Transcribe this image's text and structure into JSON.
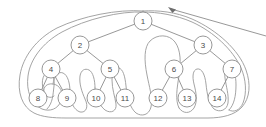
{
  "figure": {
    "colors": {
      "stroke": "#8c8c8c",
      "contour": "#9a9a9a",
      "node_fill": "#ffffff",
      "label": "#4a4a4a",
      "background": "#ffffff"
    }
  },
  "tree": {
    "node_radius": 9,
    "nodes": [
      {
        "id": "1",
        "label": "1",
        "x": 143,
        "y": 21,
        "level": 0
      },
      {
        "id": "2",
        "label": "2",
        "x": 80,
        "y": 45,
        "level": 1
      },
      {
        "id": "3",
        "label": "3",
        "x": 203,
        "y": 45,
        "level": 1
      },
      {
        "id": "4",
        "label": "4",
        "x": 51,
        "y": 69,
        "level": 2
      },
      {
        "id": "5",
        "label": "5",
        "x": 110,
        "y": 69,
        "level": 2
      },
      {
        "id": "6",
        "label": "6",
        "x": 174,
        "y": 69,
        "level": 2
      },
      {
        "id": "7",
        "label": "7",
        "x": 232,
        "y": 69,
        "level": 2
      },
      {
        "id": "8",
        "label": "8",
        "x": 38,
        "y": 98,
        "level": 3
      },
      {
        "id": "9",
        "label": "9",
        "x": 67,
        "y": 98,
        "level": 3
      },
      {
        "id": "10",
        "label": "10",
        "x": 96,
        "y": 98,
        "level": 3
      },
      {
        "id": "11",
        "label": "11",
        "x": 125,
        "y": 98,
        "level": 3
      },
      {
        "id": "12",
        "label": "12",
        "x": 158,
        "y": 98,
        "level": 3
      },
      {
        "id": "13",
        "label": "13",
        "x": 187,
        "y": 98,
        "level": 3
      },
      {
        "id": "14",
        "label": "14",
        "x": 217,
        "y": 98,
        "level": 3
      }
    ],
    "edges": [
      {
        "from": "1",
        "to": "2"
      },
      {
        "from": "1",
        "to": "3"
      },
      {
        "from": "2",
        "to": "4"
      },
      {
        "from": "2",
        "to": "5"
      },
      {
        "from": "3",
        "to": "6"
      },
      {
        "from": "3",
        "to": "7"
      },
      {
        "from": "4",
        "to": "8"
      },
      {
        "from": "4",
        "to": "9"
      },
      {
        "from": "5",
        "to": "10"
      },
      {
        "from": "5",
        "to": "11"
      },
      {
        "from": "6",
        "to": "12"
      },
      {
        "from": "6",
        "to": "13"
      },
      {
        "from": "7",
        "to": "14"
      }
    ]
  },
  "contour": {
    "name": "euler-tour-contour",
    "path": "M 143 11 C 120 9 70 18 44 36 C 24 50 17 74 19 92 C 21 108 32 117 45 117 C 58 117 66 109 66 99 C 66 90 59 84 51 84 C 47 84 44 86 44 89 M 44 89 C 44 86 47 84 51 84 C 59 84 66 90 66 99 C 66 109 58 117 45 117 M 45 117 C 58 117 66 109 66 99 C 66 90 72 84 80 84 C 88 84 94 90 94 99 C 94 109 86 117 74 117 C 86 117 94 109 94 99 C 94 90 100 84 110 84 C 110 70 110 55 116 47 C 124 37 136 36 143 37 C 151 38 162 41 168 50 C 174 58 174 72 174 84 C 183 84 189 90 189 99 C 189 109 181 117 169 117 C 181 117 189 109 189 99 C 189 90 196 84 204 84 C 212 84 218 90 218 99 C 218 109 210 117 198 117 C 216 117 232 113 240 103 C 248 92 249 76 244 62 C 237 44 216 27 192 17 C 175 11 157 9 143 11 Z",
    "lobes": [
      {
        "name": "lobe-8",
        "cx": 38,
        "cy": 99
      },
      {
        "name": "lobe-9",
        "cx": 67,
        "cy": 99
      },
      {
        "name": "lobe-10",
        "cx": 96,
        "cy": 99
      },
      {
        "name": "lobe-11",
        "cx": 125,
        "cy": 99
      },
      {
        "name": "lobe-12",
        "cx": 158,
        "cy": 99
      },
      {
        "name": "lobe-13",
        "cx": 187,
        "cy": 99
      },
      {
        "name": "lobe-14",
        "cx": 217,
        "cy": 99
      },
      {
        "name": "lobe-center-gap",
        "cx": 143,
        "cy": 75
      }
    ]
  },
  "arrow": {
    "name": "traversal-direction-arrow",
    "tip_x": 170,
    "tip_y": 8,
    "tail_x": 266,
    "tail_y": 36
  }
}
